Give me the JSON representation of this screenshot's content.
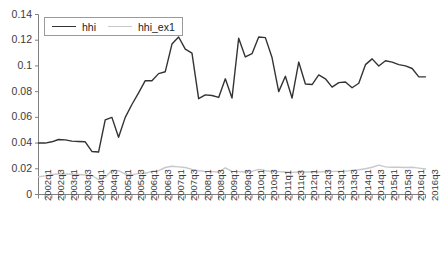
{
  "chart_data": {
    "type": "line",
    "title": "",
    "xlabel": "",
    "ylabel": "",
    "ylim": [
      0,
      0.14
    ],
    "ytick_labels": [
      "0",
      "0.02",
      "0.04",
      "0.06",
      "0.08",
      "0.1",
      "0.12",
      "0.14"
    ],
    "ytick_values": [
      0,
      0.02,
      0.04,
      0.06,
      0.08,
      0.1,
      0.12,
      0.14
    ],
    "grid": false,
    "legend_position": "top-left",
    "categories": [
      "2002q1",
      "2002q2",
      "2002q3",
      "2002q4",
      "2003q1",
      "2003q2",
      "2003q3",
      "2003q4",
      "2004q1",
      "2004q2",
      "2004q3",
      "2004q4",
      "2005q1",
      "2005q2",
      "2005q3",
      "2005q4",
      "2006q1",
      "2006q2",
      "2006q3",
      "2006q4",
      "2007q1",
      "2007q2",
      "2007q3",
      "2007q4",
      "2008q1",
      "2008q2",
      "2008q3",
      "2008q4",
      "2009q1",
      "2009q2",
      "2009q3",
      "2009q4",
      "2010q1",
      "2010q2",
      "2010q3",
      "2010q4",
      "2011q1",
      "2011q2",
      "2011q3",
      "2011q4",
      "2012q1",
      "2012q2",
      "2012q3",
      "2012q4",
      "2013q1",
      "2013q2",
      "2013q3",
      "2013q4",
      "2014q1",
      "2014q2",
      "2014q3",
      "2014q4",
      "2015q1",
      "2015q2",
      "2015q3",
      "2015q4",
      "2016q1",
      "2016q2",
      "2016q3"
    ],
    "xtick_labels_shown": [
      "2002q1",
      "2002q3",
      "2003q1",
      "2003q3",
      "2004q1",
      "2004q3",
      "2005q1",
      "2005q3",
      "2006q1",
      "2006q3",
      "2007q1",
      "2007q3",
      "2008q1",
      "2008q3",
      "2009q1",
      "2009q3",
      "2010q1",
      "2010q3",
      "2011q1",
      "2011q3",
      "2012q1",
      "2012q3",
      "2013q1",
      "2013q3",
      "2014q1",
      "2014q3",
      "2015q1",
      "2015q3",
      "2016q1",
      "2016q3"
    ],
    "series": [
      {
        "name": "hhi",
        "color": "#333333",
        "width": 1.4,
        "values": [
          0.04,
          0.04,
          0.041,
          0.0428,
          0.0425,
          0.0415,
          0.0412,
          0.041,
          0.0335,
          0.033,
          0.058,
          0.06,
          0.0445,
          0.06,
          0.07,
          0.079,
          0.0885,
          0.0885,
          0.094,
          0.0955,
          0.117,
          0.1225,
          0.113,
          0.11,
          0.0745,
          0.0775,
          0.077,
          0.0755,
          0.09,
          0.075,
          0.1215,
          0.107,
          0.1095,
          0.1225,
          0.122,
          0.1065,
          0.08,
          0.092,
          0.075,
          0.103,
          0.086,
          0.0855,
          0.093,
          0.09,
          0.0835,
          0.087,
          0.0875,
          0.083,
          0.0865,
          0.101,
          0.1055,
          0.1,
          0.104,
          0.103,
          0.101,
          0.1,
          0.098,
          0.0915,
          0.0915
        ]
      },
      {
        "name": "hhi_ex1",
        "color": "#c8c8c8",
        "width": 1.4,
        "values": [
          0.0138,
          0.0145,
          0.0155,
          0.016,
          0.016,
          0.0158,
          0.0155,
          0.0152,
          0.0148,
          0.0115,
          0.0135,
          0.0188,
          0.0185,
          0.0158,
          0.0155,
          0.0162,
          0.0165,
          0.018,
          0.0185,
          0.021,
          0.022,
          0.0215,
          0.021,
          0.0195,
          0.0185,
          0.018,
          0.0178,
          0.0175,
          0.0208,
          0.018,
          0.0178,
          0.0175,
          0.018,
          0.0195,
          0.0185,
          0.018,
          0.0178,
          0.0175,
          0.0172,
          0.0175,
          0.0175,
          0.0175,
          0.0175,
          0.0178,
          0.018,
          0.018,
          0.0182,
          0.0188,
          0.0192,
          0.02,
          0.0212,
          0.0228,
          0.0215,
          0.0212,
          0.0212,
          0.021,
          0.0212,
          0.0205,
          0.0198
        ]
      }
    ]
  },
  "legend": {
    "items": [
      {
        "label": "hhi",
        "color": "#333333"
      },
      {
        "label": "hhi_ex1",
        "color": "#c8c8c8"
      }
    ]
  },
  "axes": {
    "axis_color": "#808080",
    "tick_color": "#808080"
  }
}
